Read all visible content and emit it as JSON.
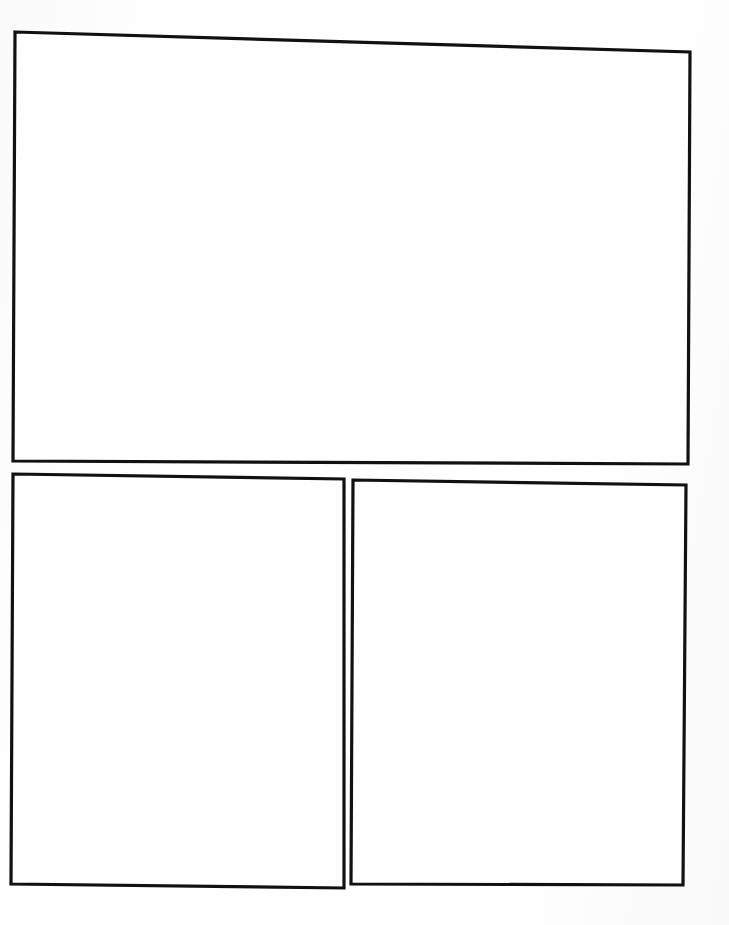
{
  "page": {
    "title": "Blank Comic Page Template",
    "kind": "comic-page-template",
    "width_px": 729,
    "height_px": 925,
    "background_color": "#fdfdfd",
    "paper_color": "#ffffff",
    "border_color": "#111111",
    "border_width_px": 3,
    "panel_count": 3,
    "content_text": "",
    "layout_description": "One wide panel across the top; two panels side by side beneath, separated by a vertical gutter."
  },
  "panels": [
    {
      "id": "panel-1",
      "label": "Panel 1",
      "position": "top",
      "row": 1,
      "column": 1,
      "fill_color": "#ffffff",
      "stroke_color": "#111111",
      "stroke_width_px": 3,
      "content": "",
      "outline_points": "15,32 690,52 688,464 13,461",
      "bounds": {
        "x": 13,
        "y": 32,
        "width": 677,
        "height": 432
      }
    },
    {
      "id": "panel-2",
      "label": "Panel 2",
      "position": "bottom-left",
      "row": 2,
      "column": 1,
      "fill_color": "#ffffff",
      "stroke_color": "#111111",
      "stroke_width_px": 3,
      "content": "",
      "outline_points": "13,474 344,479 344,888 11,884",
      "bounds": {
        "x": 11,
        "y": 474,
        "width": 333,
        "height": 414
      }
    },
    {
      "id": "panel-3",
      "label": "Panel 3",
      "position": "bottom-right",
      "row": 2,
      "column": 2,
      "fill_color": "#ffffff",
      "stroke_color": "#111111",
      "stroke_width_px": 3,
      "content": "",
      "outline_points": "353,480 686,485 683,885 351,884",
      "bounds": {
        "x": 351,
        "y": 480,
        "width": 335,
        "height": 405
      }
    }
  ],
  "gutters": {
    "horizontal_gap_px": 10,
    "vertical_gap_px": 8,
    "margin_top_px": 32,
    "margin_left_px": 13,
    "margin_right_px": 39,
    "margin_bottom_px": 37
  }
}
